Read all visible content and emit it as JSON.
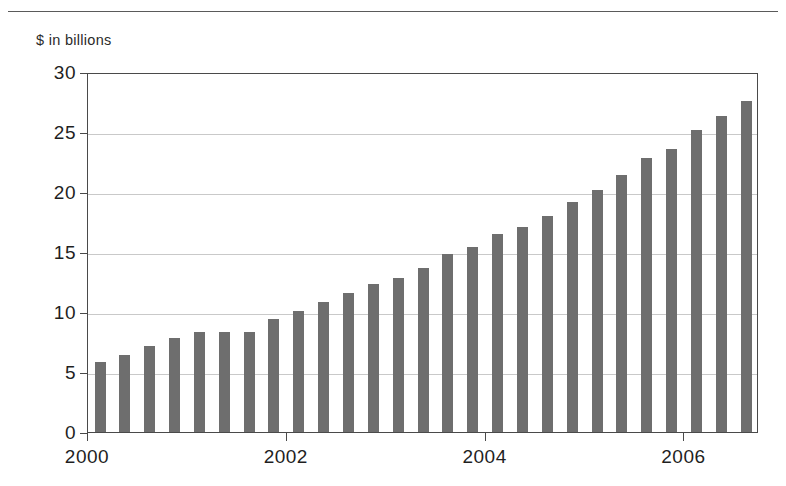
{
  "figure": {
    "caption_fragment": "",
    "unit_label": "$ in billions"
  },
  "colors": {
    "bar": "#6e6e6e",
    "axis": "#4a4a4a",
    "grid": "#c9c9c9",
    "text": "#1f1f1f",
    "background": "#ffffff"
  },
  "chart_data": {
    "type": "bar",
    "title": "",
    "subtitle": "",
    "xlabel": "",
    "ylabel": "$ in billions",
    "ylim": [
      0,
      30
    ],
    "xlim": [
      2000,
      2006.75
    ],
    "grid": true,
    "legend": null,
    "y_ticks": [
      0,
      5,
      10,
      15,
      20,
      25,
      30
    ],
    "y_tick_labels": [
      "0",
      "5",
      "10",
      "15",
      "20",
      "25",
      "30"
    ],
    "x_ticks": [
      2000,
      2002,
      2004,
      2006
    ],
    "x_tick_labels": [
      "2000",
      "2002",
      "2004",
      "2006"
    ],
    "categories": [
      "2000 Q1",
      "2000 Q2",
      "2000 Q3",
      "2000 Q4",
      "2001 Q1",
      "2001 Q2",
      "2001 Q3",
      "2001 Q4",
      "2002 Q1",
      "2002 Q2",
      "2002 Q3",
      "2002 Q4",
      "2003 Q1",
      "2003 Q2",
      "2003 Q3",
      "2003 Q4",
      "2004 Q1",
      "2004 Q2",
      "2004 Q3",
      "2004 Q4",
      "2005 Q1",
      "2005 Q2",
      "2005 Q3",
      "2005 Q4",
      "2006 Q1",
      "2006 Q2",
      "2006 Q3"
    ],
    "x": [
      2000.0,
      2000.25,
      2000.5,
      2000.75,
      2001.0,
      2001.25,
      2001.5,
      2001.75,
      2002.0,
      2002.25,
      2002.5,
      2002.75,
      2003.0,
      2003.25,
      2003.5,
      2003.75,
      2004.0,
      2004.25,
      2004.5,
      2004.75,
      2005.0,
      2005.25,
      2005.5,
      2005.75,
      2006.0,
      2006.25,
      2006.5
    ],
    "values": [
      5.8,
      6.4,
      7.2,
      7.8,
      8.3,
      8.3,
      8.3,
      9.4,
      10.1,
      10.8,
      11.6,
      12.3,
      12.8,
      13.7,
      14.8,
      15.4,
      16.5,
      17.1,
      18.0,
      19.2,
      20.2,
      21.4,
      22.8,
      23.6,
      25.2,
      26.3,
      27.6
    ]
  }
}
